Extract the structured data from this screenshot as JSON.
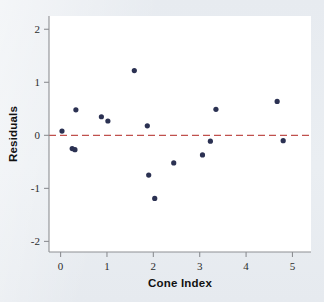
{
  "figure": {
    "background_color": "#e9edf1",
    "plot_background_color": "#ffffff",
    "point_color": "#2b3152",
    "reference_line_color": "#c0504d",
    "axis_color": "#8d8f93"
  },
  "chart_data": {
    "type": "scatter",
    "title": "",
    "xlabel": "Cone Index",
    "ylabel": "Residuals",
    "xlim": [
      -0.25,
      5.4
    ],
    "ylim": [
      -2.2,
      2.25
    ],
    "xticks": [
      0,
      1,
      2,
      3,
      4,
      5
    ],
    "xticklabels": [
      "0",
      "1",
      "2",
      "3",
      "4",
      "5"
    ],
    "yticks": [
      2,
      1,
      0,
      -1,
      -2
    ],
    "yticklabels": [
      "2",
      "1",
      "0",
      "-1",
      "-2"
    ],
    "grid": false,
    "legend": null,
    "reference_line": {
      "type": "horizontal",
      "y": 0,
      "style": "dashed",
      "color": "#c0504d"
    },
    "series": [
      {
        "name": "Residuals",
        "marker": "circle",
        "color": "#2b3152",
        "points": [
          {
            "x": 0.03,
            "y": 0.08
          },
          {
            "x": 0.25,
            "y": -0.25
          },
          {
            "x": 0.31,
            "y": -0.27
          },
          {
            "x": 0.33,
            "y": 0.48
          },
          {
            "x": 0.88,
            "y": 0.35
          },
          {
            "x": 1.02,
            "y": 0.27
          },
          {
            "x": 1.59,
            "y": 1.22
          },
          {
            "x": 1.87,
            "y": 0.18
          },
          {
            "x": 1.9,
            "y": -0.75
          },
          {
            "x": 2.03,
            "y": -1.19
          },
          {
            "x": 2.44,
            "y": -0.52
          },
          {
            "x": 3.06,
            "y": -0.37
          },
          {
            "x": 3.23,
            "y": -0.11
          },
          {
            "x": 3.35,
            "y": 0.49
          },
          {
            "x": 4.67,
            "y": 0.64
          },
          {
            "x": 4.8,
            "y": -0.1
          }
        ]
      }
    ]
  }
}
